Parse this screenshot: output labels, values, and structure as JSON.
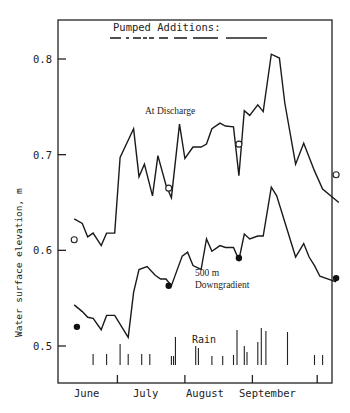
{
  "chart_data": {
    "type": "line",
    "title": "",
    "xlabel": "",
    "ylabel": "Water surface elevation, m",
    "ylim": [
      0.465,
      0.87
    ],
    "yticks": [
      0.5,
      0.6,
      0.7,
      0.8
    ],
    "ytick_labels": [
      "0.5",
      "0.6",
      "0.7",
      "0.8"
    ],
    "x_categories": [
      "June",
      "July",
      "August",
      "September"
    ],
    "x_range_days": [
      0,
      125
    ],
    "month_boundaries_day": [
      22,
      47,
      72,
      96
    ],
    "grid": false,
    "legend": "inline labels",
    "annotations": {
      "top_label": "Pumped Additions:",
      "discharge_label": "At Discharge",
      "downgradient_label_1": "500 m",
      "downgradient_label_2": "Downgradient",
      "rain_label": "Rain"
    },
    "series": [
      {
        "name": "At Discharge",
        "style": "line",
        "points": [
          [
            6,
            0.633
          ],
          [
            9,
            0.628
          ],
          [
            11,
            0.614
          ],
          [
            13,
            0.618
          ],
          [
            16,
            0.605
          ],
          [
            18,
            0.618
          ],
          [
            21,
            0.618
          ],
          [
            23,
            0.697
          ],
          [
            28,
            0.727
          ],
          [
            30,
            0.677
          ],
          [
            32,
            0.69
          ],
          [
            35,
            0.657
          ],
          [
            37,
            0.699
          ],
          [
            40,
            0.668
          ],
          [
            42,
            0.655
          ],
          [
            45,
            0.732
          ],
          [
            47,
            0.696
          ],
          [
            50,
            0.708
          ],
          [
            53,
            0.708
          ],
          [
            55,
            0.711
          ],
          [
            57,
            0.727
          ],
          [
            60,
            0.733
          ],
          [
            62,
            0.73
          ],
          [
            65,
            0.729
          ],
          [
            67,
            0.678
          ],
          [
            69,
            0.746
          ],
          [
            71,
            0.741
          ],
          [
            74,
            0.752
          ],
          [
            76,
            0.745
          ],
          [
            79,
            0.805
          ],
          [
            82,
            0.801
          ],
          [
            84,
            0.754
          ],
          [
            88,
            0.69
          ],
          [
            91,
            0.712
          ],
          [
            95,
            0.683
          ],
          [
            98,
            0.664
          ],
          [
            104,
            0.65
          ]
        ]
      },
      {
        "name": "At Discharge (measured)",
        "style": "open-circle",
        "points": [
          [
            6,
            0.611
          ],
          [
            41,
            0.665
          ],
          [
            67,
            0.711
          ],
          [
            103,
            0.679
          ]
        ]
      },
      {
        "name": "500 m Downgradient",
        "style": "line",
        "points": [
          [
            6,
            0.543
          ],
          [
            9,
            0.536
          ],
          [
            11,
            0.53
          ],
          [
            13,
            0.529
          ],
          [
            16,
            0.517
          ],
          [
            18,
            0.532
          ],
          [
            21,
            0.532
          ],
          [
            26,
            0.509
          ],
          [
            28,
            0.556
          ],
          [
            30,
            0.58
          ],
          [
            33,
            0.583
          ],
          [
            36,
            0.574
          ],
          [
            38,
            0.57
          ],
          [
            40,
            0.57
          ],
          [
            42,
            0.563
          ],
          [
            46,
            0.594
          ],
          [
            48,
            0.598
          ],
          [
            50,
            0.584
          ],
          [
            53,
            0.58
          ],
          [
            55,
            0.612
          ],
          [
            57,
            0.599
          ],
          [
            60,
            0.605
          ],
          [
            62,
            0.603
          ],
          [
            65,
            0.603
          ],
          [
            67,
            0.59
          ],
          [
            69,
            0.617
          ],
          [
            71,
            0.612
          ],
          [
            74,
            0.615
          ],
          [
            76,
            0.615
          ],
          [
            79,
            0.666
          ],
          [
            81,
            0.657
          ],
          [
            88,
            0.593
          ],
          [
            91,
            0.607
          ],
          [
            93,
            0.593
          ],
          [
            95,
            0.584
          ],
          [
            97,
            0.573
          ],
          [
            103,
            0.567
          ]
        ]
      },
      {
        "name": "500 m Downgradient (measured)",
        "style": "filled-circle",
        "points": [
          [
            7,
            0.52
          ],
          [
            41,
            0.563
          ],
          [
            67,
            0.592
          ],
          [
            103,
            0.571
          ]
        ]
      },
      {
        "name": "Rain",
        "style": "bars",
        "bars": [
          [
            13,
            11
          ],
          [
            18,
            11
          ],
          [
            23,
            21
          ],
          [
            26,
            11
          ],
          [
            31,
            11
          ],
          [
            34,
            11
          ],
          [
            42,
            9
          ],
          [
            42.8,
            9
          ],
          [
            43.5,
            28
          ],
          [
            51,
            19
          ],
          [
            52,
            17
          ],
          [
            57,
            9
          ],
          [
            61,
            9
          ],
          [
            65,
            10
          ],
          [
            66.3,
            35
          ],
          [
            69,
            19
          ],
          [
            70,
            13
          ],
          [
            74,
            23
          ],
          [
            75.3,
            37
          ],
          [
            77,
            34
          ],
          [
            85,
            33
          ],
          [
            95,
            10
          ],
          [
            98,
            10
          ]
        ]
      }
    ],
    "pumped_additions_segments": [
      [
        110,
        121
      ],
      [
        126,
        129
      ],
      [
        133,
        141
      ],
      [
        143,
        147
      ],
      [
        149,
        154
      ],
      [
        159,
        168
      ],
      [
        174,
        187
      ],
      [
        193,
        218
      ],
      [
        226,
        267
      ]
    ]
  }
}
